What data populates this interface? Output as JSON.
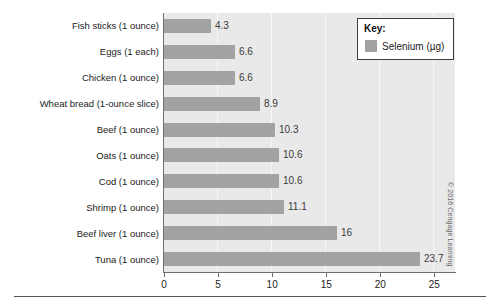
{
  "chart_data": {
    "type": "bar",
    "orientation": "horizontal",
    "title": "",
    "xlabel": "",
    "ylabel": "",
    "xlim": [
      0,
      27
    ],
    "grid": true,
    "grid_axis": "x",
    "legend_position": "top-right",
    "categories": [
      "Fish sticks (1 ounce)",
      "Eggs (1 each)",
      "Chicken (1 ounce)",
      "Wheat bread (1-ounce slice)",
      "Beef (1 ounce)",
      "Oats (1 ounce)",
      "Cod (1 ounce)",
      "Shrimp (1 ounce)",
      "Beef liver (1 ounce)",
      "Tuna (1 ounce)"
    ],
    "values": [
      4.3,
      6.6,
      6.6,
      8.9,
      10.3,
      10.6,
      10.6,
      11.1,
      16,
      23.7
    ],
    "value_labels": [
      "4.3",
      "6.6",
      "6.6",
      "8.9",
      "10.3",
      "10.6",
      "10.6",
      "11.1",
      "16",
      "23.7"
    ],
    "series": [
      {
        "name": "Selenium (µg)",
        "values": [
          4.3,
          6.6,
          6.6,
          8.9,
          10.3,
          10.6,
          10.6,
          11.1,
          16,
          23.7
        ],
        "color": "#a2a2a2"
      }
    ],
    "xticks": [
      0,
      5,
      10,
      15,
      20,
      25
    ],
    "xtick_labels": [
      "0",
      "5",
      "10",
      "15",
      "20",
      "25"
    ]
  },
  "legend": {
    "title": "Key:",
    "series_label": "Selenium (µg)",
    "swatch_color": "#a2a2a2"
  },
  "credit": {
    "text": "© 2016 Cengage Learning"
  },
  "colors": {
    "bar": "#a2a2a2",
    "plot_background": "#e9e9e9",
    "axis": "#6f6f6f",
    "text": "#1b1b1b"
  }
}
